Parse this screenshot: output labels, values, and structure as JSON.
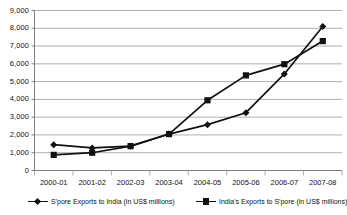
{
  "chart_data": {
    "type": "line",
    "title": "",
    "xlabel": "",
    "ylabel": "",
    "categories": [
      "2000-01",
      "2001-02",
      "2002-03",
      "2003-04",
      "2004-05",
      "2005-06",
      "2006-07",
      "2007-08"
    ],
    "series": [
      {
        "name": "S'pore Exports to India (in US$ millions)",
        "marker": "diamond",
        "color": "#111111",
        "values": [
          1450,
          1270,
          1370,
          2050,
          2580,
          3250,
          5430,
          8100
        ]
      },
      {
        "name": "India's Exports to S'pore (in US$ millions)",
        "marker": "square",
        "color": "#111111",
        "values": [
          880,
          1000,
          1370,
          2050,
          3950,
          5350,
          5980,
          7280
        ]
      }
    ],
    "ylim": [
      0,
      9000
    ],
    "yticks": [
      0,
      1000,
      2000,
      3000,
      4000,
      5000,
      6000,
      7000,
      8000,
      9000
    ],
    "ytick_labels": [
      "0",
      "1,000",
      "2,000",
      "3,000",
      "4,000",
      "5,000",
      "6,000",
      "7,000",
      "8,000",
      "9,000"
    ],
    "grid": "horizontal",
    "legend_position": "bottom"
  },
  "legend": {
    "entries": [
      {
        "label": "S'pore Exports to India (in US$ millions)",
        "marker": "diamond"
      },
      {
        "label": "India's Exports to S'pore (in US$ millions)",
        "marker": "square"
      }
    ]
  }
}
